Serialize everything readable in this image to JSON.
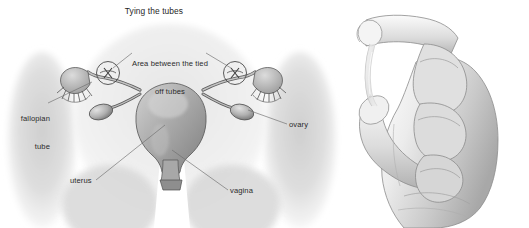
{
  "figure": {
    "title": "Tying the tubes",
    "kind": "medical-illustration",
    "style": "grayscale pencil drawing",
    "panels": [
      {
        "name": "anatomy-panel",
        "description": "Front view of female pelvis showing uterus, fallopian tubes and ovaries with tubes tied off"
      },
      {
        "name": "hand-panel",
        "description": "Hand pinching a thin translucent segment of tubing between thumb and index finger"
      }
    ]
  },
  "labels": {
    "area_between": {
      "line1": "Area between the tied",
      "line2": "off tubes"
    },
    "fallopian_tube": {
      "line1": "fallopian",
      "line2": "tube"
    },
    "ovary": "ovary",
    "uterus": "uterus",
    "vagina": "vagina"
  },
  "colors": {
    "background": "#ffffff",
    "text": "#2b2b2b",
    "leader_line": "#6e6e6e",
    "body_shadow": "#d9d9d9",
    "organ_mid": "#b4b4b4",
    "organ_dark": "#6a6a6a",
    "outline": "#4a4a4a",
    "skin_light": "#f2f2f2",
    "skin_shade": "#c9c9c9"
  }
}
